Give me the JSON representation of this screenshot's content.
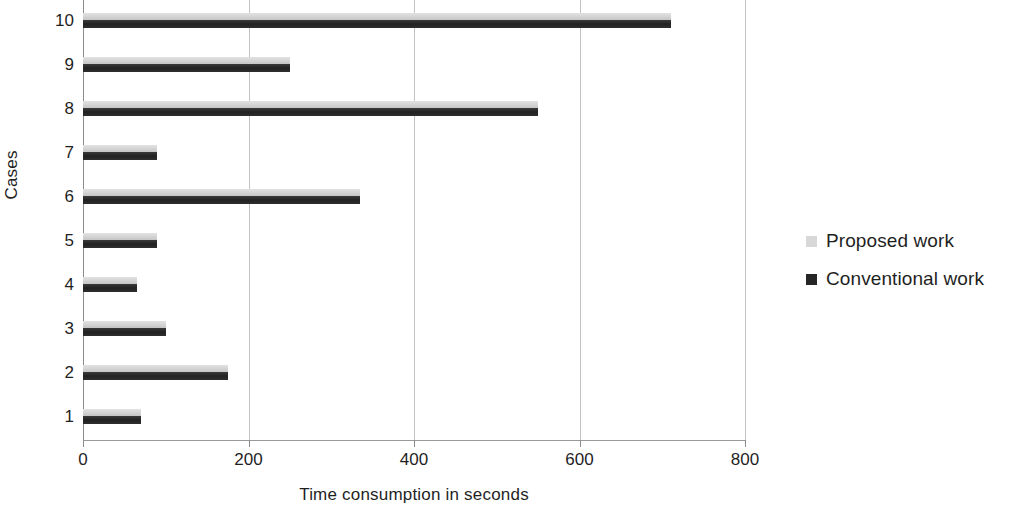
{
  "chart_data": {
    "type": "bar",
    "orientation": "horizontal",
    "title": "",
    "xlabel": "Time consumption in seconds",
    "ylabel": "Cases",
    "categories": [
      "1",
      "2",
      "3",
      "4",
      "5",
      "6",
      "7",
      "8",
      "9",
      "10"
    ],
    "series": [
      {
        "name": "Proposed work",
        "color": "#d8d8d8",
        "values": [
          70,
          175,
          100,
          65,
          90,
          335,
          90,
          550,
          250,
          710
        ]
      },
      {
        "name": "Conventional work",
        "color": "#262626",
        "values": [
          70,
          175,
          100,
          65,
          90,
          335,
          90,
          550,
          250,
          710
        ]
      }
    ],
    "xlim": [
      0,
      800
    ],
    "xticks": [
      "0",
      "200",
      "400",
      "600",
      "800"
    ],
    "grid": true,
    "legend_position": "right"
  },
  "axes": {
    "x_title": "Time consumption in seconds",
    "y_title": "Cases"
  },
  "legend": {
    "items": [
      {
        "label": "Proposed work",
        "swatch": "proposed"
      },
      {
        "label": "Conventional work",
        "swatch": "conventional"
      }
    ]
  }
}
